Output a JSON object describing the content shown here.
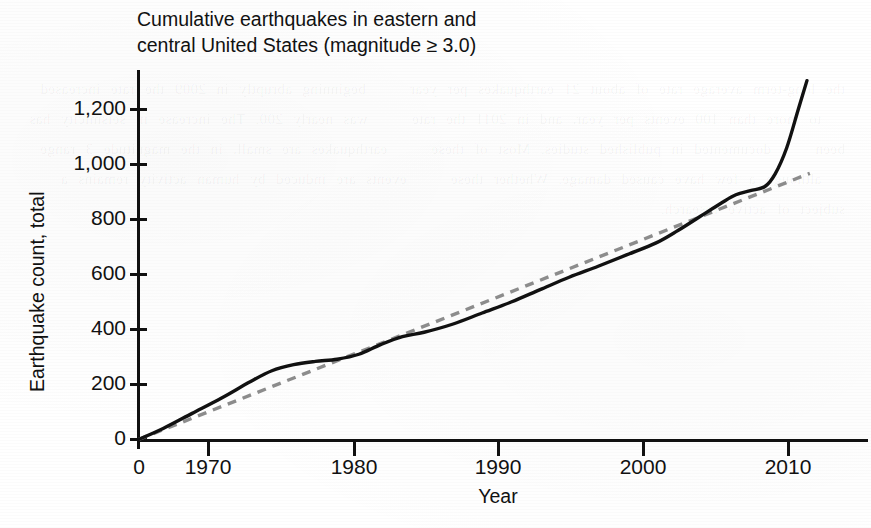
{
  "figure": {
    "title_line1": "Cumulative earthquakes in eastern and",
    "title_line2": "central United States (magnitude ≥ 3.0)",
    "title": "Cumulative earthquakes in eastern and\ncentral United States (magnitude ≥ 3.0)",
    "background_color": "#ffffff",
    "ink_color": "#111111",
    "trend_color": "#8c8c8c"
  },
  "ghost": {
    "showthrough_text": "the long-term average rate of about 21 earthquakes per year  |  beginning abruptly in 2009 the rate increased  |  to more than 100 events per year, and in 2011 the rate  |  was nearly 200. The increase in seismicity has been  |  documented in published studies. Most of these  |  earthquakes are small, in the magnitude 3 range  |  although a few have caused damage. Whether these  |  events are induced by human activity remains a  |  subject of active research."
  },
  "chart_data": {
    "type": "line",
    "title": "Cumulative earthquakes in eastern and central United States (magnitude ≥ 3.0)",
    "xlabel": "Year",
    "ylabel": "Earthquake count, total",
    "xlim": [
      1967.3,
      2014.0
    ],
    "ylim": [
      0,
      1330
    ],
    "x_axis_origin_label": "0",
    "grid": false,
    "legend": null,
    "x_ticks": [
      1970,
      1980,
      1990,
      2000,
      2010
    ],
    "x_tick_labels": [
      "1970",
      "1980",
      "1990",
      "2000",
      "2010"
    ],
    "y_ticks": [
      0,
      200,
      400,
      600,
      800,
      1000,
      1200
    ],
    "y_tick_labels": [
      "0",
      "200",
      "400",
      "600",
      "800",
      "1,000",
      "1,200"
    ],
    "series": [
      {
        "name": "Cumulative earthquake count",
        "style": "solid",
        "color": "#111111",
        "x": [
          1967.3,
          1969,
          1971,
          1973,
          1975,
          1976.5,
          1978,
          1979.5,
          1981,
          1982.5,
          1984,
          1985.5,
          1987,
          1989,
          1991,
          1993,
          1995,
          1997,
          1999,
          2001,
          2003,
          2004.5,
          2006,
          2007.5,
          2008.5,
          2009.5,
          2010.5,
          2011.2,
          2012,
          2012.8,
          2013.4
        ],
        "y": [
          0,
          40,
          95,
          150,
          210,
          250,
          272,
          284,
          292,
          310,
          345,
          374,
          390,
          420,
          460,
          500,
          545,
          590,
          630,
          672,
          715,
          760,
          810,
          860,
          890,
          905,
          920,
          965,
          1060,
          1200,
          1305
        ]
      },
      {
        "name": "Long-term average trend",
        "style": "dashed",
        "color": "#8c8c8c",
        "x": [
          1967.3,
          2013.6
        ],
        "y": [
          0,
          968
        ]
      }
    ]
  },
  "annotations": {
    "final_value": 1305,
    "trend_final_value": 968
  }
}
